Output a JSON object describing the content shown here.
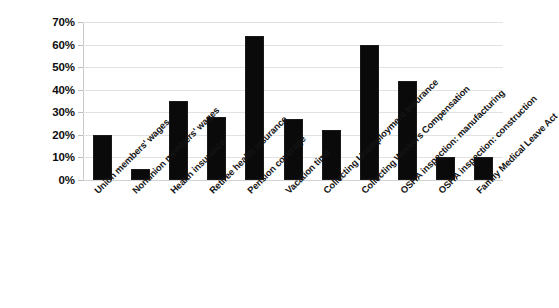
{
  "chart_data": {
    "type": "bar",
    "title": "",
    "subtitle": "",
    "xlabel": "",
    "ylabel": "",
    "ylim": [
      0,
      70
    ],
    "ytick_labels": [
      "70%",
      "60%",
      "50%",
      "40%",
      "30%",
      "20%",
      "10%",
      "0%"
    ],
    "ytick_values": [
      70,
      60,
      50,
      40,
      30,
      20,
      10,
      0
    ],
    "grid": true,
    "legend": false,
    "legend_position": "none",
    "bar_color": "#0a0a0a",
    "gridline_color": "#e2e2e2",
    "background_color": "#ffffff",
    "categories": [
      "Union members' wages",
      "Nonunion members' wages",
      "Health insurance",
      "Retiree health insurance",
      "Pension coverage",
      "Vacation time",
      "Collecting Unemployment Insurance",
      "Collecting Workers Compensation",
      "OSHA inspection: manufacturing",
      "OSHA inspection: construction",
      "Family Medical Leave Act"
    ],
    "values": [
      20,
      5,
      35,
      28,
      64,
      27,
      22,
      60,
      44,
      10,
      10
    ],
    "value_labels": [
      "20%",
      "5%",
      "35%",
      "28%",
      "64%",
      "27%",
      "22%",
      "60%",
      "44%",
      "10%",
      "10%"
    ]
  }
}
